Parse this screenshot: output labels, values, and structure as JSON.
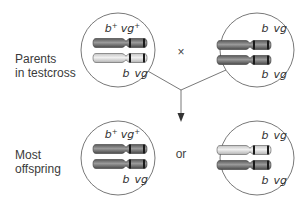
{
  "rows": {
    "parents": {
      "label_line1": "Parents",
      "label_line2": "in testcross"
    },
    "offspring": {
      "label_line1": "Most",
      "label_line2": "offspring"
    }
  },
  "operators": {
    "cross": "×",
    "or": "or"
  },
  "circles": {
    "parent_left": {
      "top_label": {
        "gene1": "b",
        "sup1": "+",
        "gene2": "vg",
        "sup2": "+"
      },
      "bottom_label": {
        "gene1": "b",
        "gene2": "vg"
      },
      "chromosomes": [
        "dark",
        "light"
      ]
    },
    "parent_right": {
      "top_label": {
        "gene1": "b",
        "gene2": "vg"
      },
      "bottom_label": {
        "gene1": "b",
        "gene2": "vg"
      },
      "chromosomes": [
        "dark",
        "dark"
      ]
    },
    "offspring_left": {
      "top_label": {
        "gene1": "b",
        "sup1": "+",
        "gene2": "vg",
        "sup2": "+"
      },
      "bottom_label": {
        "gene1": "b",
        "gene2": "vg"
      },
      "chromosomes": [
        "dark",
        "dark"
      ]
    },
    "offspring_right": {
      "top_label": {
        "gene1": "b",
        "gene2": "vg"
      },
      "bottom_label": {
        "gene1": "b",
        "gene2": "vg"
      },
      "chromosomes": [
        "light",
        "dark"
      ]
    }
  },
  "colors": {
    "dark_chromosome": "#6e6e6e",
    "dark_chromosome_highlight": "#9a9a9a",
    "light_chromosome": "#d8d8d8",
    "light_chromosome_highlight": "#eeeeee",
    "band": "#1a1a1a",
    "circle_stroke": "#555555",
    "line": "#555555"
  }
}
